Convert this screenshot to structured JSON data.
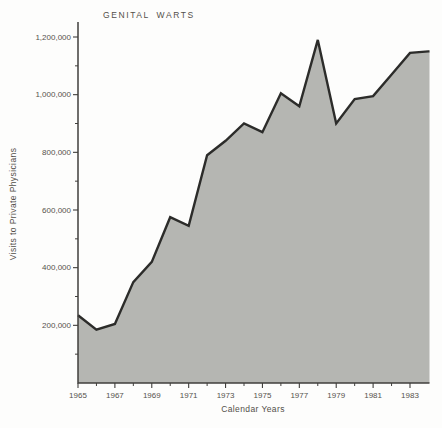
{
  "chart_data": {
    "type": "area",
    "title": "GENITAL WARTS",
    "xlabel": "Calendar Years",
    "ylabel": "Visits to Private Physicians",
    "x": [
      1965,
      1966,
      1967,
      1968,
      1969,
      1970,
      1971,
      1972,
      1973,
      1974,
      1975,
      1976,
      1977,
      1978,
      1979,
      1980,
      1981,
      1982,
      1983,
      1984
    ],
    "values": [
      235000,
      185000,
      205000,
      350000,
      420000,
      575000,
      545000,
      790000,
      840000,
      900000,
      870000,
      1005000,
      960000,
      1190000,
      900000,
      985000,
      995000,
      1070000,
      1145000,
      1150000
    ],
    "y_ticks": [
      {
        "value": 200000,
        "label": "200,000"
      },
      {
        "value": 400000,
        "label": "400,000"
      },
      {
        "value": 600000,
        "label": "600,000"
      },
      {
        "value": 800000,
        "label": "800,000"
      },
      {
        "value": 1000000,
        "label": "1,000,000"
      },
      {
        "value": 1200000,
        "label": "1,200,000"
      }
    ],
    "y_minor_ticks": [
      100000,
      300000,
      500000,
      700000,
      900000,
      1100000
    ],
    "x_ticks": [
      {
        "value": 1965,
        "label": "1965"
      },
      {
        "value": 1967,
        "label": "1967"
      },
      {
        "value": 1969,
        "label": "1969"
      },
      {
        "value": 1971,
        "label": "1971"
      },
      {
        "value": 1973,
        "label": "1973"
      },
      {
        "value": 1975,
        "label": "1975"
      },
      {
        "value": 1977,
        "label": "1977"
      },
      {
        "value": 1979,
        "label": "1979"
      },
      {
        "value": 1981,
        "label": "1981"
      },
      {
        "value": 1983,
        "label": "1983"
      }
    ],
    "x_minor_ticks": [
      1966,
      1968,
      1970,
      1972,
      1974,
      1976,
      1978,
      1980,
      1982
    ],
    "xlim": [
      1965,
      1984
    ],
    "ylim": [
      0,
      1250000
    ],
    "grid": false,
    "legend": false
  },
  "colors": {
    "area_fill": "#b5b6b2",
    "curve_line": "#2c2c2a",
    "axis_line": "#403f3c",
    "text": "#55524c",
    "background": "#fdfdfc"
  }
}
